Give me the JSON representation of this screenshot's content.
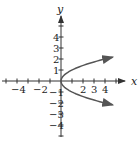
{
  "chart_data": {
    "type": "line",
    "title": "",
    "equation": "x = y^2",
    "xlabel": "x",
    "ylabel": "y",
    "xlim": [
      -5,
      5
    ],
    "ylim": [
      -5,
      5
    ],
    "grid": false,
    "x_tick_labels": [
      "-4",
      "-2",
      "2",
      "3",
      "4"
    ],
    "y_tick_labels": [
      "4",
      "3",
      "2",
      "1",
      "-1",
      "-2",
      "-3",
      "-4"
    ],
    "series": [
      {
        "name": "parabola",
        "color": "#555555",
        "points": [
          [
            4.7,
            2.17
          ],
          [
            2.25,
            1.5
          ],
          [
            1,
            1
          ],
          [
            0.25,
            0.5
          ],
          [
            0,
            0
          ],
          [
            0.25,
            -0.5
          ],
          [
            1,
            -1
          ],
          [
            2.25,
            -1.5
          ],
          [
            4.7,
            -2.17
          ]
        ],
        "arrows": "both-ends"
      }
    ]
  }
}
